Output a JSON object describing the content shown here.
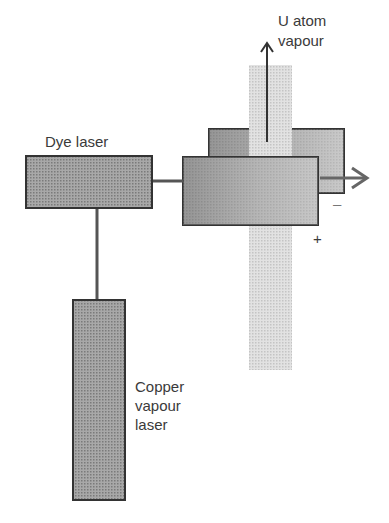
{
  "diagram": {
    "labels": {
      "u_atom": "U atom",
      "vapour": "vapour",
      "dye_laser": "Dye laser",
      "copper_line1": "Copper",
      "copper_line2": "vapour",
      "copper_line3": "laser",
      "minus": "–",
      "plus": "+"
    },
    "colors": {
      "box_fill": "#9a9a9a",
      "box_stroke": "#333333",
      "column_fill": "#d9d9d9",
      "line": "#555555"
    }
  }
}
